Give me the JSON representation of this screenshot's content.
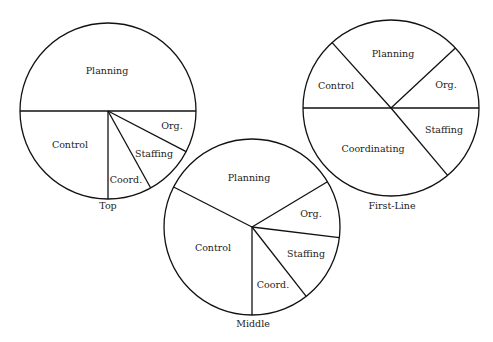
{
  "figure": {
    "background": "#ffffff",
    "stroke_color": "#111111",
    "text_color": "#222222"
  },
  "chart_data": [
    {
      "type": "pie",
      "title": "Top",
      "center": [
        108,
        111
      ],
      "radius": 88,
      "title_pos": [
        108,
        209
      ],
      "slices": [
        {
          "label": "Planning",
          "start_deg": 0,
          "end_deg": 180,
          "percent": 50,
          "label_pos": [
            107,
            74
          ]
        },
        {
          "label": "Control",
          "start_deg": 180,
          "end_deg": 270,
          "percent": 25,
          "label_pos": [
            70,
            148
          ]
        },
        {
          "label": "Coord.",
          "start_deg": 270,
          "end_deg": 299,
          "percent": 8,
          "label_pos": [
            126,
            183
          ]
        },
        {
          "label": "Staffing",
          "start_deg": 299,
          "end_deg": 332.5,
          "percent": 9,
          "label_pos": [
            154,
            157
          ]
        },
        {
          "label": "Org.",
          "start_deg": 332.5,
          "end_deg": 360,
          "percent": 8,
          "label_pos": [
            172,
            129
          ]
        }
      ]
    },
    {
      "type": "pie",
      "title": "Middle",
      "center": [
        252,
        227
      ],
      "radius": 88,
      "title_pos": [
        253,
        327
      ],
      "slices": [
        {
          "label": "Org.",
          "start_deg": -7,
          "end_deg": 31,
          "percent": 10.5,
          "label_pos": [
            311,
            217
          ]
        },
        {
          "label": "Planning",
          "start_deg": 31,
          "end_deg": 153,
          "percent": 34,
          "label_pos": [
            249,
            181
          ]
        },
        {
          "label": "Control",
          "start_deg": 153,
          "end_deg": 270,
          "percent": 32.5,
          "label_pos": [
            213,
            251
          ]
        },
        {
          "label": "Coord.",
          "start_deg": 270,
          "end_deg": 308,
          "percent": 10.5,
          "label_pos": [
            273,
            288
          ]
        },
        {
          "label": "Staffing",
          "start_deg": 308,
          "end_deg": 353,
          "percent": 12.5,
          "label_pos": [
            306,
            257
          ]
        }
      ]
    },
    {
      "type": "pie",
      "title": "First-Line",
      "center": [
        391,
        108
      ],
      "radius": 88,
      "title_pos": [
        392,
        209
      ],
      "slices": [
        {
          "label": "Org.",
          "start_deg": 0,
          "end_deg": 43,
          "percent": 12,
          "label_pos": [
            446,
            88
          ]
        },
        {
          "label": "Planning",
          "start_deg": 43,
          "end_deg": 132,
          "percent": 25,
          "label_pos": [
            393,
            57
          ]
        },
        {
          "label": "Control",
          "start_deg": 132,
          "end_deg": 180,
          "percent": 13,
          "label_pos": [
            336,
            89
          ]
        },
        {
          "label": "Coordinating",
          "start_deg": 180,
          "end_deg": 310,
          "percent": 36,
          "label_pos": [
            373,
            152
          ]
        },
        {
          "label": "Staffing",
          "start_deg": 310,
          "end_deg": 360,
          "percent": 14,
          "label_pos": [
            444,
            133
          ]
        }
      ]
    }
  ]
}
